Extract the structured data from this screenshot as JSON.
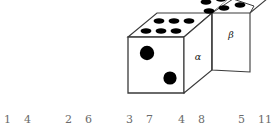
{
  "figure": {
    "colors": {
      "outline": "#3a3a3a",
      "pip": "#000000",
      "face_fill": "#ffffff",
      "number_text": "#6b6b6b",
      "label_text": "#1a1a1a"
    },
    "dice": {
      "left_die": {
        "front_face": {
          "pip_count": 2,
          "pattern": "diagonal-two"
        },
        "top_face": {
          "pip_count": 6,
          "pattern": "two-rows-of-three"
        },
        "right_face": {
          "label": "α"
        }
      },
      "right_die": {
        "top_face": {
          "pip_count": 3,
          "pattern": "diagonal-three"
        },
        "right_face": {
          "label": "β"
        }
      }
    },
    "labels": {
      "alpha": "α",
      "beta": "β"
    }
  },
  "number_row": {
    "pairs": [
      {
        "left": "1",
        "right": "4",
        "x": 4
      },
      {
        "left": "2",
        "right": "6",
        "x": 65
      },
      {
        "left": "3",
        "right": "7",
        "x": 126
      },
      {
        "left": "4",
        "right": "8",
        "x": 178
      },
      {
        "left": "5",
        "right": "11",
        "x": 238
      }
    ]
  }
}
